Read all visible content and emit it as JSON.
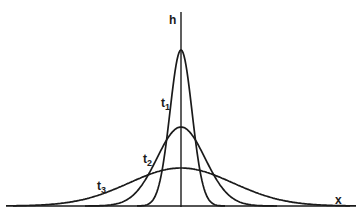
{
  "diagram": {
    "title": "",
    "axes": {
      "vertical_label": "h",
      "horizontal_label": "x"
    },
    "curves": [
      {
        "label_main": "t",
        "label_sub": "1",
        "peak_height_px": 156,
        "width_sigma_px": 11
      },
      {
        "label_main": "t",
        "label_sub": "2",
        "peak_height_px": 79,
        "width_sigma_px": 24
      },
      {
        "label_main": "t",
        "label_sub": "3",
        "peak_height_px": 38,
        "width_sigma_px": 52
      }
    ]
  }
}
